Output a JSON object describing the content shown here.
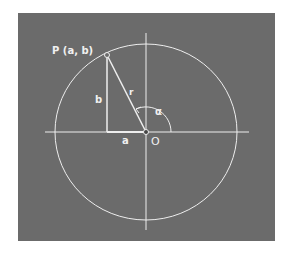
{
  "figure": {
    "point_label": "P (a, b)",
    "side_vertical": "b",
    "side_horizontal": "a",
    "hypotenuse": "r",
    "angle": "α",
    "origin": "O"
  },
  "colors": {
    "background": "#6b6b6b",
    "lines": "#eeeeee"
  }
}
